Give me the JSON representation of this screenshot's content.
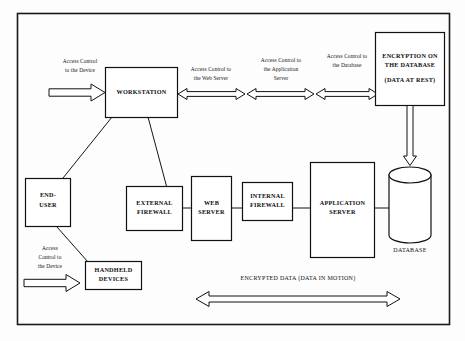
{
  "diagram": {
    "frame_color": "#1a1a1a",
    "nodes": {
      "workstation": "WORKSTATION",
      "encryption_line1": "ENCRYPTION ON",
      "encryption_line2": "THE DATABASE",
      "encryption_line3": "(DATA AT REST)",
      "end_user_line1": "END-",
      "end_user_line2": "USER",
      "handheld_line1": "HANDHELD",
      "handheld_line2": "DEVICES",
      "external_firewall_line1": "EXTERNAL",
      "external_firewall_line2": "FIREWALL",
      "web_server_line1": "WEB",
      "web_server_line2": "SERVER",
      "internal_firewall_line1": "INTERNAL",
      "internal_firewall_line2": "FIREWALL",
      "application_server_line1": "APPLICATION",
      "application_server_line2": "SERVER",
      "database_caption": "DATABASE"
    },
    "annotations": {
      "device_top_line1": "Access Control",
      "device_top_line2": "to the Device",
      "web_server_line1": "Access Control to",
      "web_server_line2": "the Web Server",
      "app_server_line1": "Access Control to",
      "app_server_line2": "the Application",
      "app_server_line3": "Server",
      "database_line1": "Access Control to",
      "database_line2": "the Database",
      "device_bottom_line1": "Access",
      "device_bottom_line2": "Control to",
      "device_bottom_line3": "the Device",
      "encrypted_motion": "ENCRYPTED DATA (DATA IN MOTION)"
    }
  }
}
